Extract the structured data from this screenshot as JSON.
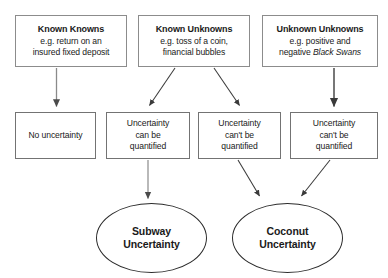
{
  "diagram": {
    "background_color": "#ffffff",
    "box_border_color": "#8c8c8c",
    "ellipse_border_color": "#2b2b2b",
    "arrow_color": "#3a3a3a",
    "text_color": "#1a1a1a"
  },
  "row_top": [
    {
      "id": "known-knowns",
      "heading": "Known Knowns",
      "detail_lines": [
        "e.g. return on an",
        "insured fixed deposit"
      ],
      "italic_part": ""
    },
    {
      "id": "known-unknowns",
      "heading": "Known Unknowns",
      "detail_lines": [
        "e.g. toss of a coin,",
        "financial bubbles"
      ],
      "italic_part": ""
    },
    {
      "id": "unknown-unknowns",
      "heading": "Unknown Unknowns",
      "detail_lines": [
        "e.g. positive and",
        "negative "
      ],
      "italic_part": "Black Swans"
    }
  ],
  "row_middle": [
    {
      "id": "no-uncertainty",
      "lines": [
        "No uncertainty"
      ]
    },
    {
      "id": "uncertainty-can-be-quantified",
      "lines": [
        "Uncertainty",
        "can be",
        "quantified"
      ]
    },
    {
      "id": "uncertainty-cant-be-quantified-1",
      "lines": [
        "Uncertainty",
        "can't be",
        "quantified"
      ]
    },
    {
      "id": "uncertainty-cant-be-quantified-2",
      "lines": [
        "Uncertainty",
        "can't be",
        "quantified"
      ]
    }
  ],
  "row_bottom": [
    {
      "id": "subway-uncertainty",
      "lines": [
        "Subway",
        "Uncertainty"
      ]
    },
    {
      "id": "coconut-uncertainty",
      "lines": [
        "Coconut",
        "Uncertainty"
      ]
    }
  ],
  "connectors": [
    {
      "id": "known-knowns-to-no-uncertainty",
      "kind": "vertical"
    },
    {
      "id": "known-unknowns-to-can-be-quantified",
      "kind": "diagonal-left"
    },
    {
      "id": "known-unknowns-to-cant-be-quantified-1",
      "kind": "diagonal-right"
    },
    {
      "id": "unknown-unknowns-to-cant-be-quantified-2",
      "kind": "vertical"
    },
    {
      "id": "can-be-quantified-to-subway",
      "kind": "vertical"
    },
    {
      "id": "cant-be-quantified-1-to-coconut",
      "kind": "diagonal-right"
    },
    {
      "id": "cant-be-quantified-2-to-coconut",
      "kind": "diagonal-left"
    }
  ]
}
